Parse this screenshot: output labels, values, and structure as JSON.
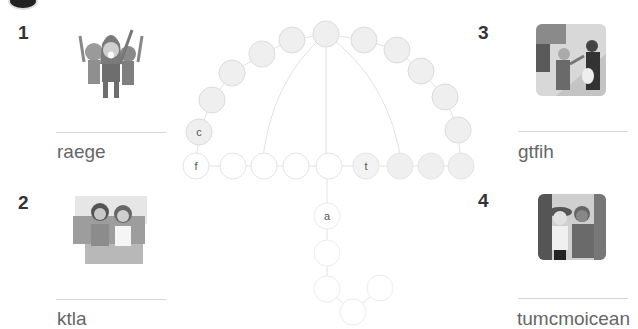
{
  "items": [
    {
      "number": "1",
      "image": "cheering-hooded-kids-illustration",
      "scrambled_word": "raege"
    },
    {
      "number": "2",
      "image": "two-women-on-sofa-illustration",
      "scrambled_word": "ktla"
    },
    {
      "number": "3",
      "image": "street-conversation-illustration",
      "scrambled_word": "gtfih"
    },
    {
      "number": "4",
      "image": "hikers-illustration",
      "scrambled_word": "tumcmoicean"
    }
  ],
  "puzzle": {
    "letters": {
      "c": "c",
      "f": "f",
      "t": "t",
      "a": "a"
    }
  },
  "colors": {
    "filled_cell": "#efefef",
    "empty_cell": "#ffffff",
    "cell_border": "#dddddd",
    "faint_border": "#eeeeee",
    "number": "#333333",
    "word": "#666666",
    "rule": "#d7d7d7"
  }
}
